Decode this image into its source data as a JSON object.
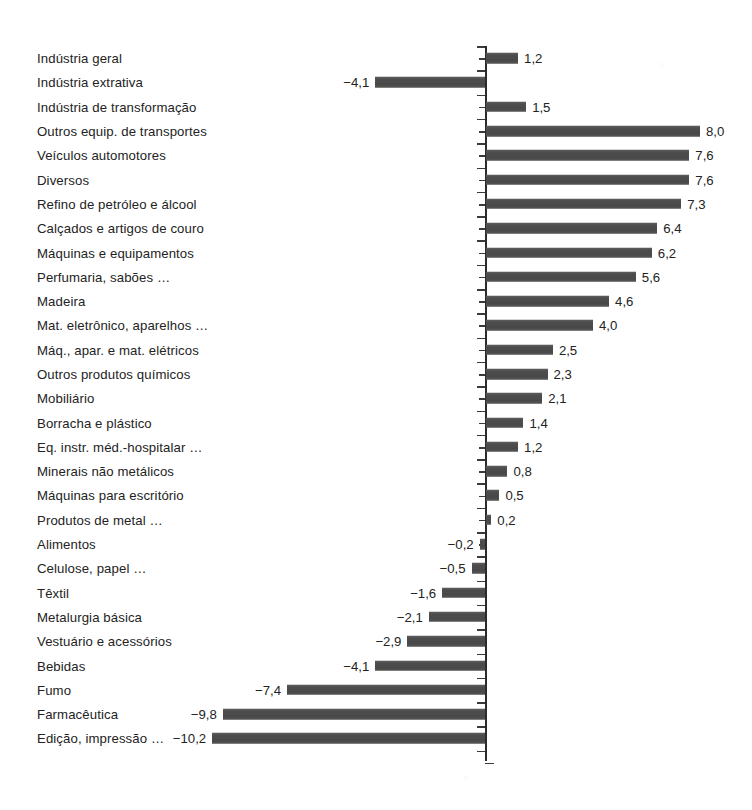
{
  "chart_data": {
    "type": "bar",
    "orientation": "horizontal",
    "title": "",
    "subtitle": "",
    "xlabel": "",
    "ylabel": "",
    "grid": false,
    "legend": null,
    "legend_position": "none",
    "axis": {
      "zero_line": true,
      "tick_marks_between_categories": true,
      "xlim": [
        -10.2,
        8.0
      ],
      "value_decimal_separator": ","
    },
    "colors": {
      "bar_fill": "#4d4d4d",
      "axis": "#2b2b2b",
      "text": "#232323",
      "background": "#ffffff"
    },
    "categories": [
      "Indústria geral",
      "Indústria extrativa",
      "Indústria de transformação",
      "Outros equip. de transportes",
      "Veículos automotores",
      "Diversos",
      "Refino de petróleo e álcool",
      "Calçados e artigos de couro",
      "Máquinas e equipamentos",
      "Perfumaria, sabões …",
      "Madeira",
      "Mat. eletrônico, aparelhos …",
      "Máq., apar. e mat. elétricos",
      "Outros produtos químicos",
      "Mobiliário",
      "Borracha e plástico",
      "Eq. instr. méd.-hospitalar …",
      "Minerais não metálicos",
      "Máquinas para escritório",
      "Produtos de metal …",
      "Alimentos",
      "Celulose, papel …",
      "Têxtil",
      "Metalurgia básica",
      "Vestuário e acessórios",
      "Bebidas",
      "Fumo",
      "Farmacêutica",
      "Edição, impressão …"
    ],
    "values": [
      1.2,
      -4.1,
      1.5,
      8.0,
      7.6,
      7.6,
      7.3,
      6.4,
      6.2,
      5.6,
      4.6,
      4.0,
      2.5,
      2.3,
      2.1,
      1.4,
      1.2,
      0.8,
      0.5,
      0.2,
      -0.2,
      -0.5,
      -1.6,
      -2.1,
      -2.9,
      -4.1,
      -7.4,
      -9.8,
      -10.2
    ],
    "value_labels": [
      "1,2",
      "−4,1",
      "1,5",
      "8,0",
      "7,6",
      "7,6",
      "7,3",
      "6,4",
      "6,2",
      "5,6",
      "4,6",
      "4,0",
      "2,5",
      "2,3",
      "2,1",
      "1,4",
      "1,2",
      "0,8",
      "0,5",
      "0,2",
      "−0,2",
      "−0,5",
      "−1,6",
      "−2,1",
      "−2,9",
      "−4,1",
      "−7,4",
      "−9,8",
      "−10,2"
    ]
  }
}
